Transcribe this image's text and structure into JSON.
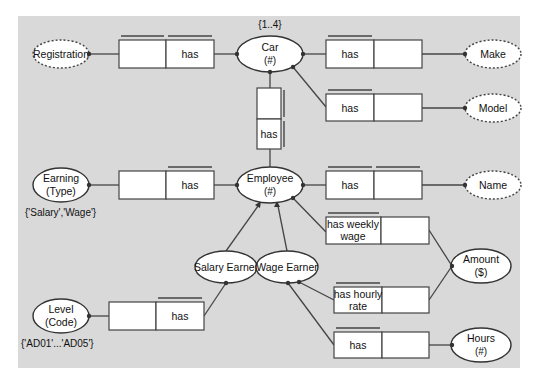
{
  "diagram": {
    "type": "ORM conceptual schema",
    "background_color": "#d9d9d9",
    "entities": [
      {
        "id": "car",
        "label": "Car",
        "refmode": "(#)",
        "constraint": "{1..4}"
      },
      {
        "id": "employee",
        "label": "Employee",
        "refmode": "(#)"
      },
      {
        "id": "earning",
        "label": "Earning",
        "refmode": "(Type)",
        "values": "{'Salary','Wage'}"
      },
      {
        "id": "level",
        "label": "Level",
        "refmode": "(Code)",
        "values": "{'AD01'...'AD05'}"
      },
      {
        "id": "salary_earner",
        "label": "Salary Earner"
      },
      {
        "id": "wage_earner",
        "label": "Wage Earner"
      },
      {
        "id": "amount",
        "label": "Amount",
        "refmode": "($)"
      },
      {
        "id": "hours",
        "label": "Hours",
        "refmode": "(#)"
      }
    ],
    "value_types": [
      {
        "id": "registration",
        "label": "Registration"
      },
      {
        "id": "make",
        "label": "Make"
      },
      {
        "id": "model",
        "label": "Model"
      },
      {
        "id": "name",
        "label": "Name"
      }
    ],
    "fact_types": [
      {
        "id": "car_registration",
        "reading": "has",
        "from": "car",
        "to": "registration"
      },
      {
        "id": "car_make",
        "reading": "has",
        "from": "car",
        "to": "make"
      },
      {
        "id": "car_model",
        "reading": "has",
        "from": "car",
        "to": "model"
      },
      {
        "id": "employee_car",
        "reading": "has",
        "from": "employee",
        "to": "car"
      },
      {
        "id": "employee_earning",
        "reading": "has",
        "from": "employee",
        "to": "earning"
      },
      {
        "id": "employee_name",
        "reading": "has",
        "from": "employee",
        "to": "name"
      },
      {
        "id": "weekly_wage",
        "reading": "has weekly wage",
        "line1": "has weekly",
        "line2": "wage",
        "from": "salary_earner",
        "to": "amount"
      },
      {
        "id": "hourly_rate",
        "reading": "has hourly rate",
        "line1": "has hourly",
        "line2": "rate",
        "from": "wage_earner",
        "to": "amount"
      },
      {
        "id": "wage_hours",
        "reading": "has",
        "from": "wage_earner",
        "to": "hours"
      },
      {
        "id": "salary_level",
        "reading": "has",
        "from": "salary_earner",
        "to": "level"
      }
    ],
    "subtypes": [
      {
        "sub": "salary_earner",
        "super": "employee"
      },
      {
        "sub": "wage_earner",
        "super": "employee"
      }
    ]
  }
}
